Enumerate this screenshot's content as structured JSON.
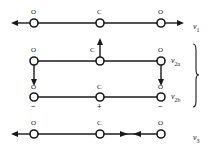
{
  "figure": {
    "stroke_color": "#1a1a1a",
    "background_color": "#ffffff",
    "atom_radius": 4
  },
  "atoms": {
    "oxygen": "O",
    "carbon": "C"
  },
  "signs": {
    "minus": "−",
    "plus": "+"
  },
  "modes": [
    {
      "id": "nu1",
      "label_symbol": "ν",
      "label_sub": "1",
      "name": "symmetric-stretch",
      "atoms": [
        {
          "element": "O",
          "cx": 34,
          "cy": 23
        },
        {
          "element": "C",
          "cx": 100,
          "cy": 23
        },
        {
          "element": "O",
          "cx": 161,
          "cy": 23
        }
      ],
      "arrows": [
        {
          "dir": "left",
          "from_x": 34,
          "to_x": 12,
          "y": 23
        },
        {
          "dir": "right",
          "from_x": 161,
          "to_x": 184,
          "y": 23
        }
      ]
    },
    {
      "id": "nu2a",
      "label_symbol": "ν",
      "label_sub": "2a",
      "name": "bend-degenerate-a",
      "atoms": [
        {
          "element": "O",
          "cx": 34,
          "cy": 61
        },
        {
          "element": "C",
          "cx": 100,
          "cy": 61
        },
        {
          "element": "O",
          "cx": 161,
          "cy": 61
        }
      ],
      "arrows": [
        {
          "dir": "down",
          "x": 34,
          "from_y": 61,
          "to_y": 85
        },
        {
          "dir": "up",
          "x": 100,
          "from_y": 61,
          "to_y": 39
        },
        {
          "dir": "down",
          "x": 161,
          "from_y": 61,
          "to_y": 85
        }
      ]
    },
    {
      "id": "nu2b",
      "label_symbol": "ν",
      "label_sub": "2b",
      "name": "bend-degenerate-b",
      "atoms": [
        {
          "element": "O",
          "cx": 34,
          "cy": 97,
          "sign": "−"
        },
        {
          "element": "C",
          "cx": 100,
          "cy": 97,
          "sign": "+"
        },
        {
          "element": "O",
          "cx": 161,
          "cy": 97,
          "sign": "−"
        }
      ],
      "arrows": []
    },
    {
      "id": "nu3",
      "label_symbol": "ν",
      "label_sub": "3",
      "name": "asymmetric-stretch",
      "atoms": [
        {
          "element": "O",
          "cx": 34,
          "cy": 134
        },
        {
          "element": "C",
          "cx": 100,
          "cy": 134
        },
        {
          "element": "O",
          "cx": 161,
          "cy": 134
        }
      ],
      "arrows": [
        {
          "dir": "left",
          "from_x": 34,
          "to_x": 12,
          "y": 134
        },
        {
          "dir": "right",
          "from_x": 100,
          "to_x": 128,
          "y": 134
        },
        {
          "dir": "left",
          "from_x": 161,
          "to_x": 133,
          "y": 134
        }
      ]
    }
  ],
  "brace": {
    "name": "degenerate-pair-brace",
    "top_y": 44,
    "bottom_y": 107,
    "x": 196
  }
}
